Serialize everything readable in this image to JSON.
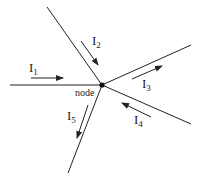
{
  "diagram": {
    "node": {
      "label": "node",
      "x": 102,
      "y": 85
    },
    "colors": {
      "stroke": "#222222",
      "background": "#ffffff"
    },
    "branches": [
      {
        "id": "b1",
        "x2": 10,
        "y2": 85
      },
      {
        "id": "b2",
        "x2": 47,
        "y2": 7
      },
      {
        "id": "b3",
        "x2": 191,
        "y2": 45
      },
      {
        "id": "b4",
        "x2": 191,
        "y2": 124
      },
      {
        "id": "b5",
        "x2": 68,
        "y2": 173
      }
    ],
    "currents": [
      {
        "name": "I",
        "sub": "1",
        "direction": "into node"
      },
      {
        "name": "I",
        "sub": "2",
        "direction": "into node"
      },
      {
        "name": "I",
        "sub": "3",
        "direction": "out of node"
      },
      {
        "name": "I",
        "sub": "4",
        "direction": "into node"
      },
      {
        "name": "I",
        "sub": "5",
        "direction": "out of node"
      }
    ]
  }
}
